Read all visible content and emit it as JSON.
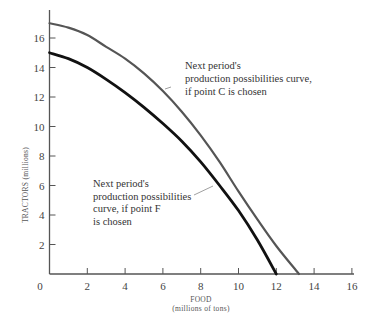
{
  "chart_data": {
    "type": "line",
    "title": "",
    "xlabel": "FOOD",
    "xlabel_sub": "(millions of tons)",
    "ylabel": "TRACTORS (millions)",
    "xlim": [
      0,
      16
    ],
    "ylim": [
      0,
      17
    ],
    "x_ticks": [
      0,
      2,
      4,
      6,
      8,
      10,
      12,
      14,
      16
    ],
    "y_ticks": [
      2,
      4,
      6,
      8,
      10,
      12,
      14,
      16
    ],
    "grid": false,
    "legend": null,
    "series": [
      {
        "name": "Next period's production possibilities curve, if point C is chosen",
        "color": "#555555",
        "points": [
          [
            0,
            17.0
          ],
          [
            1,
            16.7
          ],
          [
            2,
            16.2
          ],
          [
            3,
            15.4
          ],
          [
            4,
            14.6
          ],
          [
            5,
            13.6
          ],
          [
            6,
            12.4
          ],
          [
            7,
            11.0
          ],
          [
            8,
            9.4
          ],
          [
            9,
            7.6
          ],
          [
            10,
            5.6
          ],
          [
            11,
            3.7
          ],
          [
            12,
            1.9
          ],
          [
            13.2,
            0
          ]
        ]
      },
      {
        "name": "Next period's production possibilities curve, if point F is chosen",
        "color": "#111111",
        "points": [
          [
            0,
            15.0
          ],
          [
            1,
            14.6
          ],
          [
            2,
            14.0
          ],
          [
            3,
            13.2
          ],
          [
            4,
            12.3
          ],
          [
            5,
            11.3
          ],
          [
            6,
            10.2
          ],
          [
            7,
            9.0
          ],
          [
            8,
            7.6
          ],
          [
            9,
            6.0
          ],
          [
            10,
            4.3
          ],
          [
            11,
            2.3
          ],
          [
            12,
            0
          ]
        ]
      }
    ],
    "annotations": [
      {
        "series": 0,
        "lines": [
          "Next period's",
          "production possibilities curve,",
          "if point C is chosen"
        ]
      },
      {
        "series": 1,
        "lines": [
          "Next period's",
          "production possibilities",
          "curve, if point F",
          "is chosen"
        ]
      }
    ]
  }
}
